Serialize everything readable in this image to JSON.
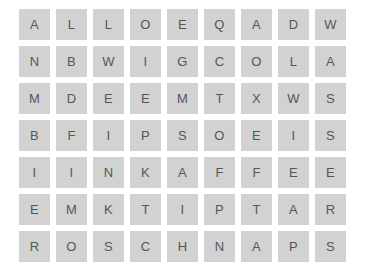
{
  "puzzle": {
    "type": "word-search-grid",
    "rows": 7,
    "columns": 9,
    "cell_background": "#d2d2d2",
    "letter_color": "#565656",
    "page_background": "#ffffff",
    "grid": [
      [
        "A",
        "L",
        "L",
        "O",
        "E",
        "Q",
        "A",
        "D",
        "W"
      ],
      [
        "N",
        "B",
        "W",
        "I",
        "G",
        "C",
        "O",
        "L",
        "A"
      ],
      [
        "M",
        "D",
        "E",
        "E",
        "M",
        "T",
        "X",
        "W",
        "S"
      ],
      [
        "B",
        "F",
        "I",
        "P",
        "S",
        "O",
        "E",
        "I",
        "S"
      ],
      [
        "I",
        "I",
        "N",
        "K",
        "A",
        "F",
        "F",
        "E",
        "E"
      ],
      [
        "E",
        "M",
        "K",
        "T",
        "I",
        "P",
        "T",
        "A",
        "R"
      ],
      [
        "R",
        "O",
        "S",
        "C",
        "H",
        "N",
        "A",
        "P",
        "S"
      ]
    ]
  }
}
